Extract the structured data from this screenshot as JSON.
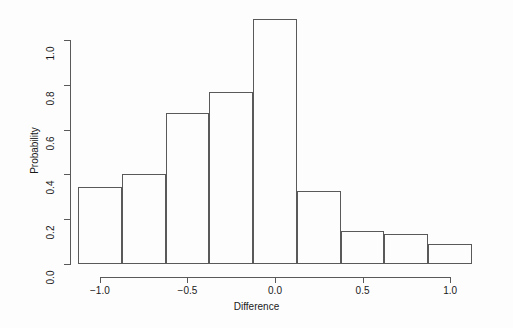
{
  "chart_data": {
    "type": "bar",
    "subtype": "histogram",
    "title": "",
    "xlabel": "Difference",
    "ylabel": "Probability",
    "grid": false,
    "legend": null,
    "xlim": [
      -1.125,
      1.125
    ],
    "ylim": [
      0.0,
      1.095
    ],
    "xticks": [
      -1.0,
      -0.5,
      0.0,
      0.5,
      1.0
    ],
    "xtick_labels": [
      "-1.0",
      "-0.5",
      "0.0",
      "0.5",
      "1.0"
    ],
    "yticks": [
      0.0,
      0.2,
      0.4,
      0.6,
      0.8,
      1.0
    ],
    "ytick_labels": [
      "0.0",
      "0.2",
      "0.4",
      "0.6",
      "0.8",
      "1.0"
    ],
    "bin_width": 0.25,
    "bin_edges": [
      -1.125,
      -0.875,
      -0.625,
      -0.375,
      -0.125,
      0.125,
      0.375,
      0.625,
      0.875,
      1.125
    ],
    "bin_centers": [
      -1.0,
      -0.75,
      -0.5,
      -0.25,
      0.0,
      0.25,
      0.5,
      0.75,
      1.0
    ],
    "categories": [
      "-1.125..-0.875",
      "-0.875..-0.625",
      "-0.625..-0.375",
      "-0.375..-0.125",
      "-0.125..0.125",
      "0.125..0.375",
      "0.375..0.625",
      "0.625..0.875",
      "0.875..1.125"
    ],
    "values": [
      0.345,
      0.4,
      0.675,
      0.77,
      1.095,
      0.325,
      0.148,
      0.133,
      0.09
    ],
    "bar_edge_color": "#595959",
    "bar_fill_color": "transparent",
    "axis_color": "#595959",
    "background_color": "#fdfdfd"
  }
}
